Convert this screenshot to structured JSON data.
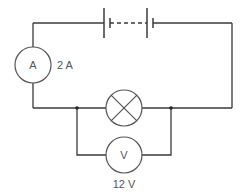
{
  "diagram": {
    "type": "circuit",
    "components": {
      "battery": {
        "label": "",
        "description": "multi-cell battery (cells joined by dashed line)"
      },
      "ammeter": {
        "symbol": "A",
        "reading": "2 A"
      },
      "lamp": {
        "symbol": "crossed-circle",
        "label": ""
      },
      "voltmeter": {
        "symbol": "V",
        "reading": "12 V"
      }
    },
    "connections": [
      "battery in series at top wire",
      "ammeter in series on left wire",
      "lamp in series on bottom wire",
      "voltmeter in parallel across lamp"
    ],
    "colors": {
      "wire": "#3a3a3a",
      "component": "#555555",
      "background": "#ffffff"
    }
  }
}
